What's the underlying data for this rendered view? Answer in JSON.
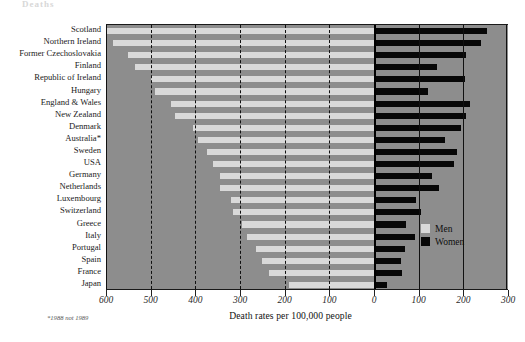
{
  "title_fragment": "Deaths",
  "legend": {
    "position": "inside-right",
    "items": [
      {
        "label": "Men",
        "color": "#d9d9d9",
        "name": "men"
      },
      {
        "label": "Women",
        "color": "#070707",
        "name": "women"
      }
    ]
  },
  "axis": {
    "title": "Death rates per 100,000 people",
    "footnote": "*1988 not 1989",
    "tick_labels": [
      "600",
      "500",
      "400",
      "300",
      "200",
      "100",
      "0",
      "100",
      "200",
      "300"
    ],
    "tick_values": [
      -600,
      -500,
      -400,
      -300,
      -200,
      -100,
      0,
      100,
      200,
      300
    ]
  },
  "colors": {
    "plot_background": "#8d8d8d",
    "men_bar": "#d9d9d9",
    "women_bar": "#070707",
    "gridline": "#111111",
    "text": "#1b1b1b"
  },
  "chart_data": {
    "type": "bar",
    "orientation": "horizontal",
    "subtype": "population-pyramid",
    "title": "Deaths",
    "xlabel": "Death rates per 100,000 people",
    "ylabel": "",
    "xlim": [
      -600,
      300
    ],
    "xticks": [
      -600,
      -500,
      -400,
      -300,
      -200,
      -100,
      0,
      100,
      200,
      300
    ],
    "grid": true,
    "legend": [
      "Men",
      "Women"
    ],
    "annotation": "*1988 not 1989",
    "categories": [
      "Scotland",
      "Northern Ireland",
      "Former Czechoslovakia",
      "Finland",
      "Republic of Ireland",
      "Hungary",
      "England & Wales",
      "New Zealand",
      "Denmark",
      "Australia*",
      "Sweden",
      "USA",
      "Germany",
      "Netherlands",
      "Luxembourg",
      "Switzerland",
      "Greece",
      "Italy",
      "Portugal",
      "Spain",
      "France",
      "Japan"
    ],
    "series": [
      {
        "name": "Men",
        "color": "#d9d9d9",
        "values": [
          598,
          585,
          550,
          535,
          500,
          490,
          455,
          445,
          405,
          395,
          375,
          360,
          345,
          345,
          320,
          315,
          295,
          285,
          265,
          250,
          235,
          190
        ]
      },
      {
        "name": "Women",
        "color": "#070707",
        "values": [
          253,
          240,
          207,
          140,
          203,
          120,
          215,
          205,
          195,
          160,
          185,
          180,
          130,
          145,
          95,
          105,
          72,
          92,
          70,
          60,
          62,
          30
        ]
      }
    ]
  }
}
